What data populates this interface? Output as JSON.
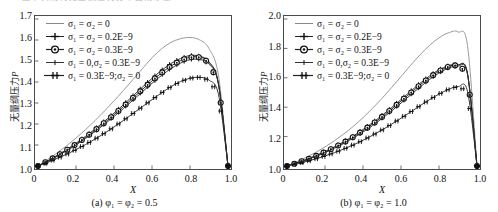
{
  "top_fragment": "图中实线为无量纲压力分布曲线示意",
  "axis": {
    "y_label_text": "无量纲压力",
    "y_label_symbol": "P",
    "x_label": "X"
  },
  "series_labels": [
    "σ₁ = σ₂ = 0",
    "σ₁ = σ₂ = 0.2E−9",
    "σ₁ = σ₂ = 0.3E−9",
    "σ₁ = 0,σ₂ = 0.3E−9",
    "σ₁ = 0.3E−9;σ₂ = 0"
  ],
  "panels": [
    {
      "key": "a",
      "caption": "(a) φ₁ = φ₂ = 0.5",
      "yticks": [
        "1.0",
        "1.1",
        "1.2",
        "1.3",
        "1.4",
        "1.5",
        "1.6",
        "1.7"
      ],
      "xticks": [
        "0",
        "0.2",
        "0.4",
        "0.6",
        "0.8",
        "1.0"
      ]
    },
    {
      "key": "b",
      "caption": "(b) φ₁ = φ₂ = 1.0",
      "yticks": [
        "1.0",
        "1.2",
        "1.4",
        "1.6",
        "1.8",
        "2.0"
      ],
      "xticks": [
        "0",
        "0.2",
        "0.4",
        "0.6",
        "0.8",
        "1.0"
      ]
    }
  ],
  "chart_data": [
    {
      "type": "line",
      "title": "(a) φ₁ = φ₂ = 0.5",
      "xlabel": "X",
      "ylabel": "无量纲压力P",
      "xlim": [
        0,
        1.0
      ],
      "ylim": [
        1.0,
        1.7
      ],
      "xticks": [
        0,
        0.2,
        0.4,
        0.6,
        0.8,
        1.0
      ],
      "yticks": [
        1.0,
        1.1,
        1.2,
        1.3,
        1.4,
        1.5,
        1.6,
        1.7
      ],
      "grid": false,
      "legend_position": "top-left",
      "x": [
        0,
        0.05,
        0.1,
        0.15,
        0.2,
        0.25,
        0.3,
        0.35,
        0.4,
        0.45,
        0.5,
        0.55,
        0.6,
        0.65,
        0.7,
        0.75,
        0.8,
        0.85,
        0.9,
        0.95,
        1.0
      ],
      "series": [
        {
          "name": "σ₁ = σ₂ = 0",
          "marker": "none",
          "values": [
            1.0,
            1.03,
            1.062,
            1.096,
            1.133,
            1.173,
            1.216,
            1.262,
            1.31,
            1.36,
            1.412,
            1.464,
            1.515,
            1.558,
            1.589,
            1.606,
            1.612,
            1.601,
            1.559,
            1.43,
            1.0
          ]
        },
        {
          "name": "σ₁ = σ₂ = 0.2E−9",
          "marker": "plus",
          "values": [
            1.0,
            1.024,
            1.05,
            1.078,
            1.108,
            1.141,
            1.176,
            1.213,
            1.252,
            1.292,
            1.334,
            1.376,
            1.417,
            1.455,
            1.488,
            1.512,
            1.526,
            1.523,
            1.496,
            1.39,
            1.0
          ]
        },
        {
          "name": "σ₁ = σ₂ = 0.3E−9",
          "marker": "circle",
          "values": [
            1.0,
            1.023,
            1.048,
            1.075,
            1.104,
            1.136,
            1.17,
            1.206,
            1.244,
            1.283,
            1.324,
            1.365,
            1.405,
            1.443,
            1.476,
            1.502,
            1.518,
            1.518,
            1.494,
            1.392,
            1.0
          ]
        },
        {
          "name": "σ₁ = 0,σ₂ = 0.3E−9",
          "marker": "tick",
          "values": [
            1.0,
            1.022,
            1.046,
            1.072,
            1.1,
            1.131,
            1.164,
            1.199,
            1.236,
            1.274,
            1.314,
            1.354,
            1.394,
            1.431,
            1.464,
            1.49,
            1.506,
            1.507,
            1.486,
            1.388,
            1.0
          ]
        },
        {
          "name": "σ₁ = 0.3E−9;σ₂ = 0",
          "marker": "star",
          "values": [
            1.0,
            1.017,
            1.036,
            1.056,
            1.078,
            1.102,
            1.128,
            1.156,
            1.186,
            1.217,
            1.25,
            1.283,
            1.316,
            1.348,
            1.378,
            1.402,
            1.418,
            1.422,
            1.409,
            1.34,
            1.0
          ]
        }
      ]
    },
    {
      "type": "line",
      "title": "(b) φ₁ = φ₂ = 1.0",
      "xlabel": "X",
      "ylabel": "无量纲压力P",
      "xlim": [
        0,
        1.0
      ],
      "ylim": [
        1.0,
        2.0
      ],
      "xticks": [
        0,
        0.2,
        0.4,
        0.6,
        0.8,
        1.0
      ],
      "yticks": [
        1.0,
        1.2,
        1.4,
        1.6,
        1.8,
        2.0
      ],
      "grid": false,
      "legend_position": "top-left",
      "x": [
        0,
        0.05,
        0.1,
        0.15,
        0.2,
        0.25,
        0.3,
        0.35,
        0.4,
        0.45,
        0.5,
        0.55,
        0.6,
        0.65,
        0.7,
        0.75,
        0.8,
        0.85,
        0.9,
        0.95,
        1.0
      ],
      "series": [
        {
          "name": "σ₁ = σ₂ = 0",
          "marker": "none",
          "values": [
            1.0,
            1.028,
            1.058,
            1.092,
            1.13,
            1.172,
            1.219,
            1.271,
            1.329,
            1.392,
            1.46,
            1.533,
            1.608,
            1.684,
            1.756,
            1.82,
            1.872,
            1.906,
            1.912,
            1.82,
            1.0
          ]
        },
        {
          "name": "σ₁ = σ₂ = 0.2E−9",
          "marker": "plus",
          "values": [
            1.0,
            1.021,
            1.044,
            1.07,
            1.099,
            1.131,
            1.166,
            1.205,
            1.248,
            1.294,
            1.344,
            1.397,
            1.452,
            1.508,
            1.562,
            1.612,
            1.654,
            1.682,
            1.69,
            1.626,
            1.0
          ]
        },
        {
          "name": "σ₁ = σ₂ = 0.3E−9",
          "marker": "circle",
          "values": [
            1.0,
            1.02,
            1.042,
            1.067,
            1.095,
            1.126,
            1.16,
            1.198,
            1.24,
            1.285,
            1.334,
            1.386,
            1.441,
            1.496,
            1.551,
            1.601,
            1.645,
            1.676,
            1.688,
            1.63,
            1.0
          ]
        },
        {
          "name": "σ₁ = 0,σ₂ = 0.3E−9",
          "marker": "tick",
          "values": [
            1.0,
            1.019,
            1.04,
            1.064,
            1.091,
            1.121,
            1.154,
            1.191,
            1.231,
            1.275,
            1.323,
            1.374,
            1.428,
            1.483,
            1.537,
            1.588,
            1.633,
            1.666,
            1.68,
            1.624,
            1.0
          ]
        },
        {
          "name": "σ₁ = 0.3E−9;σ₂ = 0",
          "marker": "star",
          "values": [
            1.0,
            1.014,
            1.03,
            1.048,
            1.068,
            1.091,
            1.116,
            1.144,
            1.175,
            1.209,
            1.245,
            1.284,
            1.325,
            1.367,
            1.41,
            1.451,
            1.489,
            1.521,
            1.54,
            1.508,
            1.0
          ]
        }
      ]
    }
  ]
}
